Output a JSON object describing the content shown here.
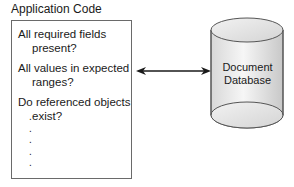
{
  "diagram": {
    "app_box": {
      "title": "Application Code",
      "questions": [
        {
          "line1": "All required fields",
          "line2": "present?"
        },
        {
          "line1": "All values in expected",
          "line2": "ranges?"
        },
        {
          "line1": "Do referenced objects",
          "line2": "exist?"
        }
      ],
      "ellipsis_dots": [
        ".",
        ".",
        ".",
        ".",
        "."
      ]
    },
    "connector": {
      "type": "bidirectional-arrow",
      "color": "#1a1a1a"
    },
    "database": {
      "line1": "Document",
      "line2": "Database",
      "fill_light": "#f4f4f4",
      "fill_dark": "#cfcfcf",
      "stroke": "#555555"
    }
  }
}
